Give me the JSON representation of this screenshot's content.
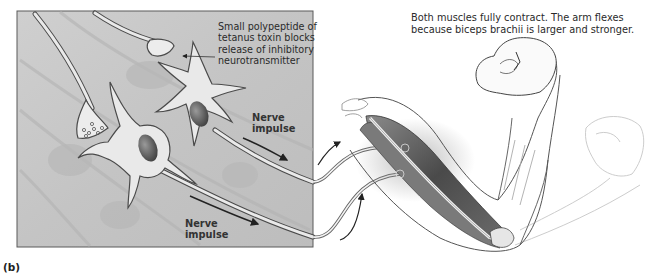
{
  "figure": {
    "panel_label": "(b)",
    "caption": "Both muscles fully contract. The arm flexes because biceps brachii is larger and stronger.",
    "inset": {
      "toxin_label": "Small polypeptide of tetanus toxin blocks release of inhibitory neurotransmitter",
      "nerve_impulse_upper": "Nerve impulse",
      "nerve_impulse_lower": "Nerve impulse"
    },
    "colors": {
      "inset_background": "#c9c9c9",
      "neuron_fill": "#e9e9e9",
      "outline": "#4a4a4a",
      "muscle": "#5a5a5a",
      "text": "#2a2a2a"
    }
  }
}
